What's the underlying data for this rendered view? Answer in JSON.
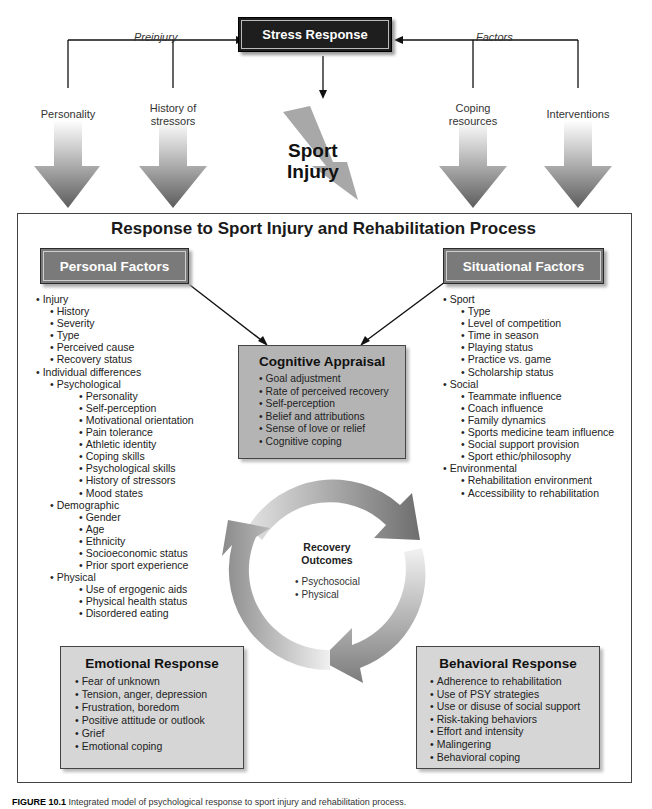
{
  "top": {
    "stress_response": "Stress Response",
    "preinjury_label": "Preinjury",
    "factors_label": "Factors",
    "left_factors": [
      "Personality",
      "History of\nstressors"
    ],
    "right_factors": [
      "Coping\nresources",
      "Interventions"
    ],
    "sport_injury_line1": "Sport",
    "sport_injury_line2": "Injury"
  },
  "main": {
    "title": "Response to Sport Injury and Rehabilitation Process",
    "personal_factors": {
      "label": "Personal Factors",
      "items": [
        {
          "level": 1,
          "text": "Injury"
        },
        {
          "level": 2,
          "text": "History"
        },
        {
          "level": 2,
          "text": "Severity"
        },
        {
          "level": 2,
          "text": "Type"
        },
        {
          "level": 2,
          "text": "Perceived cause"
        },
        {
          "level": 2,
          "text": "Recovery status"
        },
        {
          "level": 1,
          "text": "Individual differences"
        },
        {
          "level": 2,
          "text": "Psychological"
        },
        {
          "level": 3,
          "text": "Personality"
        },
        {
          "level": 3,
          "text": "Self-perception"
        },
        {
          "level": 3,
          "text": "Motivational orientation"
        },
        {
          "level": 3,
          "text": "Pain tolerance"
        },
        {
          "level": 3,
          "text": "Athletic identity"
        },
        {
          "level": 3,
          "text": "Coping skills"
        },
        {
          "level": 3,
          "text": "Psychological skills"
        },
        {
          "level": 3,
          "text": "History of stressors"
        },
        {
          "level": 3,
          "text": "Mood states"
        },
        {
          "level": 2,
          "text": "Demographic"
        },
        {
          "level": 3,
          "text": "Gender"
        },
        {
          "level": 3,
          "text": "Age"
        },
        {
          "level": 3,
          "text": "Ethnicity"
        },
        {
          "level": 3,
          "text": "Socioeconomic status"
        },
        {
          "level": 3,
          "text": "Prior sport experience"
        },
        {
          "level": 2,
          "text": "Physical"
        },
        {
          "level": 3,
          "text": "Use of ergogenic aids"
        },
        {
          "level": 3,
          "text": "Physical health status"
        },
        {
          "level": 3,
          "text": "Disordered eating"
        }
      ]
    },
    "situational_factors": {
      "label": "Situational Factors",
      "items": [
        {
          "level": 1,
          "text": "Sport"
        },
        {
          "level": 2,
          "text": "Type"
        },
        {
          "level": 2,
          "text": "Level of competition"
        },
        {
          "level": 2,
          "text": "Time in season"
        },
        {
          "level": 2,
          "text": "Playing status"
        },
        {
          "level": 2,
          "text": "Practice vs. game"
        },
        {
          "level": 2,
          "text": "Scholarship status"
        },
        {
          "level": 1,
          "text": "Social"
        },
        {
          "level": 2,
          "text": "Teammate influence"
        },
        {
          "level": 2,
          "text": "Coach influence"
        },
        {
          "level": 2,
          "text": "Family dynamics"
        },
        {
          "level": 2,
          "text": "Sports medicine team influence"
        },
        {
          "level": 2,
          "text": "Social support provision"
        },
        {
          "level": 2,
          "text": "Sport ethic/philosophy"
        },
        {
          "level": 1,
          "text": "Environmental"
        },
        {
          "level": 2,
          "text": "Rehabilitation environment"
        },
        {
          "level": 2,
          "text": "Accessibility to rehabilitation"
        }
      ]
    },
    "cognitive_appraisal": {
      "title": "Cognitive Appraisal",
      "items": [
        "Goal adjustment",
        "Rate of perceived recovery",
        "Self-perception",
        "Belief and attributions",
        "Sense of love or relief",
        "Cognitive coping"
      ]
    },
    "recovery_outcomes": {
      "title_line1": "Recovery",
      "title_line2": "Outcomes",
      "items": [
        "Psychosocial",
        "Physical"
      ]
    },
    "emotional_response": {
      "title": "Emotional Response",
      "items": [
        "Fear of unknown",
        "Tension, anger, depression",
        "Frustration, boredom",
        "Positive attitude or outlook",
        "Grief",
        "Emotional coping"
      ]
    },
    "behavioral_response": {
      "title": "Behavioral Response",
      "items": [
        "Adherence to rehabilitation",
        "Use of PSY strategies",
        "Use or disuse of social support",
        "Risk-taking behaviors",
        "Effort and intensity",
        "Malingering",
        "Behavioral coping"
      ]
    }
  },
  "caption": {
    "label": "FIGURE 10.1",
    "text": "Integrated model of psychological response to sport injury and rehabilitation process."
  }
}
